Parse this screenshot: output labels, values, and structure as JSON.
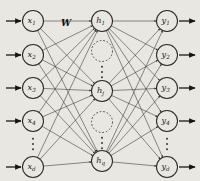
{
  "figure": {
    "background_color": "#e9e7e2",
    "ink_color": "#2b2b2b",
    "width": 200,
    "height": 181
  },
  "weight_label": {
    "text": "W",
    "x": 66,
    "y": 23
  },
  "layers": {
    "input": {
      "name": "input-layer",
      "cx": 33,
      "radius": 10.5,
      "nodes": [
        {
          "id": "x1",
          "base": "x",
          "sub": "1",
          "cy": 21
        },
        {
          "id": "x2",
          "base": "x",
          "sub": "2",
          "cy": 55
        },
        {
          "id": "x3",
          "base": "x",
          "sub": "3",
          "cy": 88
        },
        {
          "id": "x4",
          "base": "x",
          "sub": "4",
          "cy": 121
        },
        {
          "id": "xd",
          "base": "x",
          "sub": "d",
          "cy": 167
        }
      ],
      "ellipsis": {
        "cx": 33,
        "cy": 144,
        "dots": 3
      }
    },
    "hidden": {
      "name": "hidden-layer",
      "cx": 102,
      "radius": 10.5,
      "nodes": [
        {
          "id": "h1",
          "base": "h",
          "sub": "1",
          "cy": 21
        },
        {
          "id": "hj",
          "base": "h",
          "sub": "j",
          "cy": 91
        },
        {
          "id": "hq",
          "base": "h",
          "sub": "q",
          "cy": 161
        }
      ],
      "placeholders": [
        {
          "id": "hidden-placeholder-upper",
          "cx": 102,
          "cy": 51
        },
        {
          "id": "hidden-placeholder-lower",
          "cx": 102,
          "cy": 122
        }
      ],
      "ellipses": [
        {
          "cx": 102,
          "cy": 72,
          "dots": 3
        },
        {
          "cx": 102,
          "cy": 143,
          "dots": 3
        }
      ]
    },
    "output": {
      "name": "output-layer",
      "cx": 167,
      "radius": 10.5,
      "nodes": [
        {
          "id": "y1",
          "base": "y",
          "sub": "1",
          "cy": 21
        },
        {
          "id": "y2",
          "base": "y",
          "sub": "2",
          "cy": 55
        },
        {
          "id": "y3",
          "base": "y",
          "sub": "3",
          "cy": 88
        },
        {
          "id": "y4",
          "base": "y",
          "sub": "4",
          "cy": 121
        },
        {
          "id": "yd",
          "base": "y",
          "sub": "d",
          "cy": 167
        }
      ],
      "ellipsis": {
        "cx": 167,
        "cy": 144,
        "dots": 3
      }
    }
  },
  "io_arrows": {
    "input_arrow_start_x": 6,
    "input_arrow_end_x": 21,
    "output_arrow_start_x": 179,
    "output_arrow_end_x": 195
  },
  "connections": {
    "input_to_hidden_count": 15,
    "hidden_to_output_count": 15,
    "fully_connected": true
  }
}
